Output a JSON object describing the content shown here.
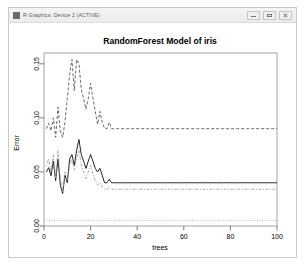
{
  "window": {
    "title": "R Graphics: Device 2 (ACTIVE)",
    "icon": "r-app-icon",
    "buttons": {
      "minimize": "Minimize",
      "maximize": "Maximize",
      "close": "Close"
    }
  },
  "chart_data": {
    "type": "line",
    "title": "RandomForest Model of iris",
    "xlabel": "trees",
    "ylabel": "Error",
    "xlim": [
      0,
      100
    ],
    "ylim": [
      0.0,
      0.16
    ],
    "grid": false,
    "legend": null,
    "xticks": [
      0,
      20,
      40,
      60,
      80,
      100
    ],
    "xtick_labels": [
      "0",
      "20",
      "40",
      "60",
      "80",
      "100"
    ],
    "yticks": [
      0.0,
      0.05,
      0.1,
      0.15
    ],
    "ytick_labels": [
      "0.00",
      "0.05",
      "0.10",
      "0.15"
    ],
    "x": [
      1,
      2,
      3,
      4,
      5,
      6,
      7,
      8,
      9,
      10,
      11,
      12,
      13,
      14,
      15,
      16,
      17,
      18,
      19,
      20,
      21,
      22,
      23,
      24,
      25,
      26,
      27,
      28,
      29,
      30,
      31,
      32,
      33,
      34,
      35,
      36,
      37,
      38,
      39,
      40,
      41,
      42,
      43,
      44,
      45,
      46,
      47,
      48,
      49,
      50,
      51,
      52,
      53,
      54,
      55,
      56,
      57,
      58,
      59,
      60,
      61,
      62,
      63,
      64,
      65,
      66,
      67,
      68,
      69,
      70,
      71,
      72,
      73,
      74,
      75,
      76,
      77,
      78,
      79,
      80,
      81,
      82,
      83,
      84,
      85,
      86,
      87,
      88,
      89,
      90,
      91,
      92,
      93,
      94,
      95,
      96,
      97,
      98,
      99,
      100
    ],
    "series": [
      {
        "name": "OOB",
        "style": "solid",
        "color": "#000000",
        "values": [
          0.05,
          0.054,
          0.0465,
          0.06,
          0.042,
          0.062,
          0.038,
          0.03,
          0.047,
          0.04,
          0.062,
          0.066,
          0.056,
          0.07,
          0.08,
          0.066,
          0.06,
          0.0533,
          0.06,
          0.066,
          0.06,
          0.0533,
          0.05,
          0.0533,
          0.0467,
          0.04,
          0.04,
          0.0433,
          0.04,
          0.04,
          0.04,
          0.04,
          0.04,
          0.04,
          0.04,
          0.04,
          0.04,
          0.04,
          0.04,
          0.04,
          0.04,
          0.04,
          0.04,
          0.04,
          0.04,
          0.04,
          0.04,
          0.04,
          0.04,
          0.04,
          0.04,
          0.04,
          0.04,
          0.04,
          0.04,
          0.04,
          0.04,
          0.04,
          0.04,
          0.04,
          0.04,
          0.04,
          0.04,
          0.04,
          0.04,
          0.04,
          0.04,
          0.04,
          0.04,
          0.04,
          0.04,
          0.04,
          0.04,
          0.04,
          0.04,
          0.04,
          0.04,
          0.04,
          0.04,
          0.04,
          0.04,
          0.04,
          0.04,
          0.04,
          0.04,
          0.04,
          0.04,
          0.04,
          0.04,
          0.04,
          0.04,
          0.04,
          0.04,
          0.04,
          0.04,
          0.04,
          0.04,
          0.04,
          0.04,
          0.04
        ]
      },
      {
        "name": "virginica",
        "style": "dashed",
        "color": "#4d4d4d",
        "values": [
          0.09,
          0.095,
          0.088,
          0.1,
          0.082,
          0.11,
          0.088,
          0.082,
          0.096,
          0.118,
          0.14,
          0.154,
          0.125,
          0.154,
          0.15,
          0.126,
          0.118,
          0.108,
          0.118,
          0.132,
          0.118,
          0.106,
          0.094,
          0.106,
          0.096,
          0.09,
          0.09,
          0.096,
          0.09,
          0.09,
          0.09,
          0.09,
          0.09,
          0.09,
          0.09,
          0.09,
          0.09,
          0.09,
          0.09,
          0.09,
          0.09,
          0.09,
          0.09,
          0.09,
          0.09,
          0.09,
          0.09,
          0.09,
          0.09,
          0.09,
          0.09,
          0.09,
          0.09,
          0.09,
          0.09,
          0.09,
          0.09,
          0.09,
          0.09,
          0.09,
          0.09,
          0.09,
          0.09,
          0.09,
          0.09,
          0.09,
          0.09,
          0.09,
          0.09,
          0.09,
          0.09,
          0.09,
          0.09,
          0.09,
          0.09,
          0.09,
          0.09,
          0.09,
          0.09,
          0.09,
          0.09,
          0.09,
          0.09,
          0.09,
          0.09,
          0.09,
          0.09,
          0.09,
          0.09,
          0.09,
          0.09,
          0.09,
          0.09,
          0.09,
          0.09,
          0.09,
          0.09,
          0.09,
          0.09,
          0.09
        ]
      },
      {
        "name": "versicolor",
        "style": "dotdash",
        "color": "#9a9a9a",
        "values": [
          0.056,
          0.062,
          0.05,
          0.066,
          0.044,
          0.07,
          0.044,
          0.032,
          0.05,
          0.042,
          0.056,
          0.062,
          0.052,
          0.062,
          0.07,
          0.056,
          0.05,
          0.044,
          0.05,
          0.056,
          0.048,
          0.042,
          0.038,
          0.04,
          0.036,
          0.034,
          0.034,
          0.036,
          0.034,
          0.034,
          0.034,
          0.034,
          0.034,
          0.034,
          0.034,
          0.034,
          0.034,
          0.034,
          0.034,
          0.034,
          0.034,
          0.034,
          0.034,
          0.034,
          0.034,
          0.034,
          0.034,
          0.034,
          0.034,
          0.034,
          0.034,
          0.034,
          0.034,
          0.034,
          0.034,
          0.034,
          0.034,
          0.034,
          0.034,
          0.034,
          0.034,
          0.034,
          0.034,
          0.034,
          0.034,
          0.034,
          0.034,
          0.034,
          0.034,
          0.034,
          0.034,
          0.034,
          0.034,
          0.034,
          0.034,
          0.034,
          0.034,
          0.034,
          0.034,
          0.034,
          0.034,
          0.034,
          0.034,
          0.034,
          0.034,
          0.034,
          0.034,
          0.034,
          0.034,
          0.034,
          0.034,
          0.034,
          0.034,
          0.034,
          0.034,
          0.034,
          0.034,
          0.034,
          0.034,
          0.034
        ]
      },
      {
        "name": "setosa",
        "style": "dotted",
        "color": "#a8a8a8",
        "values": [
          0.005,
          0.005,
          0.005,
          0.005,
          0.005,
          0.005,
          0.005,
          0.005,
          0.005,
          0.005,
          0.005,
          0.005,
          0.005,
          0.005,
          0.005,
          0.005,
          0.005,
          0.005,
          0.005,
          0.005,
          0.005,
          0.005,
          0.005,
          0.005,
          0.005,
          0.005,
          0.005,
          0.005,
          0.005,
          0.005,
          0.005,
          0.005,
          0.005,
          0.005,
          0.005,
          0.005,
          0.005,
          0.005,
          0.005,
          0.005,
          0.005,
          0.005,
          0.005,
          0.005,
          0.005,
          0.005,
          0.005,
          0.005,
          0.005,
          0.005,
          0.005,
          0.005,
          0.005,
          0.005,
          0.005,
          0.005,
          0.005,
          0.005,
          0.005,
          0.005,
          0.005,
          0.005,
          0.005,
          0.005,
          0.005,
          0.005,
          0.005,
          0.005,
          0.005,
          0.005,
          0.005,
          0.005,
          0.005,
          0.005,
          0.005,
          0.005,
          0.005,
          0.005,
          0.005,
          0.005,
          0.005,
          0.005,
          0.005,
          0.005,
          0.005,
          0.005,
          0.005,
          0.005,
          0.005,
          0.005,
          0.005,
          0.005,
          0.005,
          0.005,
          0.005,
          0.005,
          0.005,
          0.005,
          0.005,
          0.005
        ]
      }
    ]
  }
}
